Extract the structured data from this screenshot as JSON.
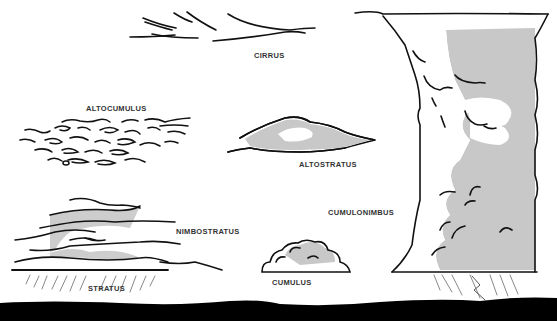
{
  "diagram": {
    "background": "#ffffff",
    "colors": {
      "outline": "#111111",
      "shade": "#c8c8c8",
      "ground": "#000000",
      "rain": "#888888"
    },
    "labels": [
      {
        "id": "cirrus",
        "text": "CIRRUS"
      },
      {
        "id": "altocumulus",
        "text": "ALTOCUMULUS"
      },
      {
        "id": "altostratus",
        "text": "ALTOSTRATUS"
      },
      {
        "id": "nimbostratus",
        "text": "NIMBOSTRATUS"
      },
      {
        "id": "cumulonimbus",
        "text": "CUMULONIMBUS"
      },
      {
        "id": "stratus",
        "text": "STRATUS"
      },
      {
        "id": "cumulus",
        "text": "CUMULUS"
      }
    ]
  }
}
